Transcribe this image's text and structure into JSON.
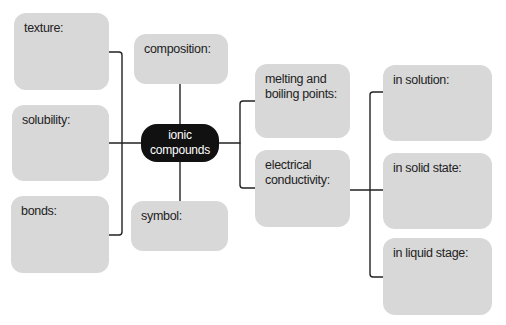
{
  "diagram": {
    "center": {
      "label": "ionic\ncompounds",
      "color": "#111111",
      "text_color": "#ffffff"
    },
    "left_branches": [
      {
        "label": "texture:"
      },
      {
        "label": "solubility:"
      },
      {
        "label": "bonds:"
      }
    ],
    "top_branch": {
      "label": "composition:"
    },
    "bottom_branch": {
      "label": "symbol:"
    },
    "right_branches": [
      {
        "label": "melting and\nboiling points:"
      },
      {
        "label": "electrical\nconductivity:"
      }
    ],
    "conductivity_branches": [
      {
        "label": "in solution:"
      },
      {
        "label": "in solid state:"
      },
      {
        "label": "in liquid stage:"
      }
    ],
    "colors": {
      "box_fill": "#d8d8d8",
      "line": "#222222",
      "text": "#222222"
    }
  }
}
